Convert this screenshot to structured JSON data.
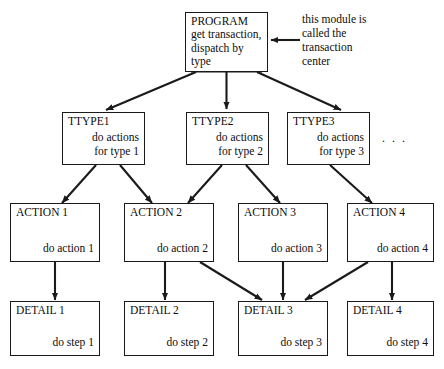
{
  "diagram": {
    "type": "structure-chart",
    "title_note": {
      "lines": [
        "this module is",
        "called the",
        "transaction",
        "center"
      ]
    },
    "ellipsis": ". . .",
    "nodes": {
      "program": {
        "title": "PROGRAM",
        "line1": "get transaction,",
        "line2": "dispatch by type"
      },
      "ttype1": {
        "title": "TTYPE1",
        "line1": "do actions",
        "line2": "for type 1"
      },
      "ttype2": {
        "title": "TTYPE2",
        "line1": "do actions",
        "line2": "for type 2"
      },
      "ttype3": {
        "title": "TTYPE3",
        "line1": "do actions",
        "line2": "for type 3"
      },
      "action1": {
        "title": "ACTION 1",
        "line1": "do action 1"
      },
      "action2": {
        "title": "ACTION 2",
        "line1": "do action 2"
      },
      "action3": {
        "title": "ACTION 3",
        "line1": "do action 3"
      },
      "action4": {
        "title": "ACTION 4",
        "line1": "do action 4"
      },
      "detail1": {
        "title": "DETAIL 1",
        "line1": "do step 1"
      },
      "detail2": {
        "title": "DETAIL 2",
        "line1": "do step 2"
      },
      "detail3": {
        "title": "DETAIL 3",
        "line1": "do step 3"
      },
      "detail4": {
        "title": "DETAIL 4",
        "line1": "do step 4"
      }
    },
    "edges": [
      {
        "from": "program",
        "to": "ttype1"
      },
      {
        "from": "program",
        "to": "ttype2"
      },
      {
        "from": "program",
        "to": "ttype3"
      },
      {
        "from": "ttype1",
        "to": "action1"
      },
      {
        "from": "ttype1",
        "to": "action2"
      },
      {
        "from": "ttype2",
        "to": "action2"
      },
      {
        "from": "ttype2",
        "to": "action3"
      },
      {
        "from": "ttype3",
        "to": "action4"
      },
      {
        "from": "action1",
        "to": "detail1"
      },
      {
        "from": "action2",
        "to": "detail2"
      },
      {
        "from": "action2",
        "to": "detail3"
      },
      {
        "from": "action3",
        "to": "detail3"
      },
      {
        "from": "action4",
        "to": "detail3"
      },
      {
        "from": "action4",
        "to": "detail4"
      }
    ],
    "colors": {
      "line": "#1a1a1a",
      "text": "#0d0d0d",
      "background": "#ffffff"
    }
  }
}
